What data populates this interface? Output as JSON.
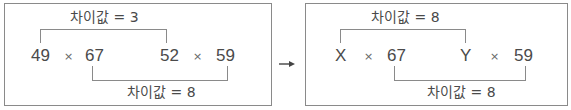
{
  "left_panel": {
    "top_label": "차이값 = 3",
    "bottom_label": "차이값 = 8",
    "terms": [
      "49",
      "67",
      "52",
      "59"
    ],
    "operator": "×"
  },
  "arrow": "→",
  "right_panel": {
    "top_label": "차이값 = 8",
    "bottom_label": "차이값 = 8",
    "terms": [
      "X",
      "67",
      "Y",
      "59"
    ],
    "operator": "×"
  },
  "colors": {
    "line": "#8a8a8a",
    "text": "#4a4a4a"
  }
}
